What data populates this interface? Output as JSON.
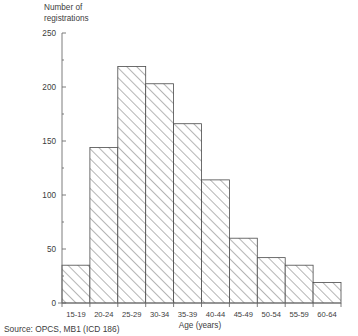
{
  "chart_data": {
    "type": "bar",
    "title": "",
    "ylabel": "Number of\nregistrations",
    "xlabel": "Age (years)",
    "categories": [
      "15-19",
      "20-24",
      "25-29",
      "30-34",
      "35-39",
      "40-44",
      "45-49",
      "50-54",
      "55-59",
      "60-64"
    ],
    "values": [
      35,
      144,
      219,
      203,
      166,
      114,
      60,
      42,
      35,
      19
    ],
    "ylim": [
      0,
      250
    ],
    "yticks": [
      0,
      50,
      100,
      150,
      200,
      250
    ],
    "ytick_labels": [
      "0",
      "50",
      "100",
      "150",
      "200",
      "250"
    ],
    "minor_ytick_step": 25,
    "grid": false,
    "legend": null,
    "bar_fill": "hatch-diagonal",
    "bar_edge_color": "#4a4a4a",
    "axis_color": "#6e6e6e",
    "text_color": "#3d3d3d",
    "background": "#ffffff"
  },
  "source_note": "Source:  OPCS, MB1 (ICD 186)"
}
